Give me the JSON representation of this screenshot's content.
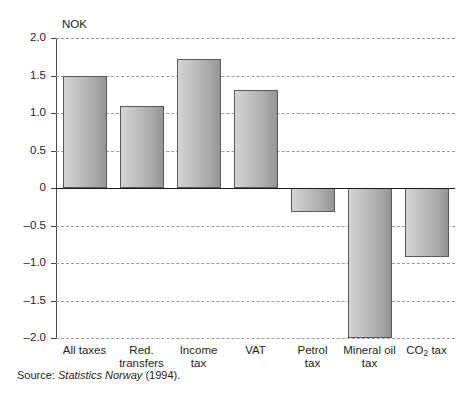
{
  "chart_data": {
    "type": "bar",
    "title": "",
    "xlabel": "",
    "ylabel": "NOK",
    "unit_label": "NOK",
    "categories": [
      "All taxes",
      "Red. transfers",
      "Income tax",
      "VAT",
      "Petrol tax",
      "Mineral oil tax",
      "CO2 tax"
    ],
    "values": [
      1.5,
      1.1,
      1.72,
      1.31,
      -0.32,
      -2.0,
      -0.92
    ],
    "ylim": [
      -2.0,
      2.0
    ],
    "yticks": [
      "2.0",
      "1.5",
      "1.0",
      "0.5",
      "0",
      "–0.5",
      "–1.0",
      "–1.5",
      "–2.0"
    ],
    "ytick_values": [
      2.0,
      1.5,
      1.0,
      0.5,
      0,
      -0.5,
      -1.0,
      -1.5,
      -2.0
    ],
    "grid": true,
    "legend": null,
    "bar_color": "#b9b9b9",
    "bar_border_color": "#595959",
    "gridline_color": "#9a9a9a",
    "zero_line_color": "#1a1a1a"
  },
  "axis": {
    "unit": "NOK",
    "ticks": [
      {
        "label": "2.0",
        "value": 2.0
      },
      {
        "label": "1.5",
        "value": 1.5
      },
      {
        "label": "1.0",
        "value": 1.0
      },
      {
        "label": "0.5",
        "value": 0.5
      },
      {
        "label": "0",
        "value": 0
      },
      {
        "label": "–0.5",
        "value": -0.5
      },
      {
        "label": "–1.0",
        "value": -1.0
      },
      {
        "label": "–1.5",
        "value": -1.5
      },
      {
        "label": "–2.0",
        "value": -2.0
      }
    ]
  },
  "bars": [
    {
      "label_line1": "All taxes",
      "label_line2": "",
      "value": 1.5
    },
    {
      "label_line1": "Red.",
      "label_line2": "transfers",
      "value": 1.1
    },
    {
      "label_line1": "Income",
      "label_line2": "tax",
      "value": 1.72
    },
    {
      "label_line1": "VAT",
      "label_line2": "",
      "value": 1.31
    },
    {
      "label_line1": "Petrol",
      "label_line2": "tax",
      "value": -0.32
    },
    {
      "label_line1": "Mineral oil",
      "label_line2": "tax",
      "value": -2.0
    },
    {
      "label_line1": "CO2 tax",
      "label_line2": "",
      "value": -0.92
    }
  ],
  "source": {
    "prefix": "Source:",
    "publisher": "Statistics Norway",
    "year": "(1994)."
  }
}
